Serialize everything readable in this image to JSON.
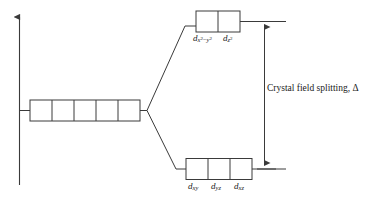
{
  "diagram": {
    "title_caption": "Crystal field splitting, Δ",
    "colors": {
      "line": "#3a3a3a",
      "background": "#ffffff",
      "text": "#1a1a1a"
    },
    "axis": {
      "name": "energy-axis",
      "arrow": "up"
    },
    "levels": {
      "free_ion": {
        "name": "free-ion-d-orbitals",
        "box_count": 5,
        "labels": []
      },
      "upper": {
        "name": "eg-orbitals",
        "box_count": 2,
        "labels": [
          {
            "base": "d",
            "sub_html": "x<sup>2</sup>−y<sup>2</sup>",
            "plain": "d x2-y2"
          },
          {
            "base": "d",
            "sub_html": "z<sup>2</sup>",
            "plain": "d z2"
          }
        ]
      },
      "lower": {
        "name": "t2g-orbitals",
        "box_count": 3,
        "labels": [
          {
            "base": "d",
            "sub_html": "xy",
            "plain": "d xy"
          },
          {
            "base": "d",
            "sub_html": "yz",
            "plain": "d yz"
          },
          {
            "base": "d",
            "sub_html": "xz",
            "plain": "d xz"
          }
        ]
      }
    },
    "splitting_arrow": {
      "name": "crystal-field-splitting-arrow",
      "double_headed": true,
      "symbol": "Δ"
    }
  }
}
